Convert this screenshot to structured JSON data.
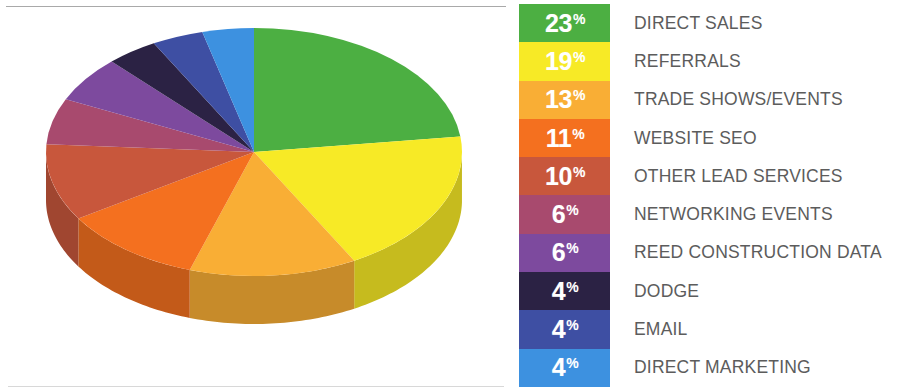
{
  "chart_data": {
    "type": "pie",
    "title": "",
    "subtitle": "",
    "xlabel": "",
    "ylabel": "",
    "legend_position": "right",
    "grid": false,
    "three_d": true,
    "start_angle_deg": 0,
    "direction": "clockwise",
    "units": "%",
    "categories": [
      "DIRECT SALES",
      "REFERRALS",
      "TRADE SHOWS/EVENTS",
      "WEBSITE SEO",
      "OTHER LEAD SERVICES",
      "NETWORKING EVENTS",
      "REED CONSTRUCTION DATA",
      "DODGE",
      "EMAIL",
      "DIRECT MARKETING"
    ],
    "values": [
      23,
      19,
      13,
      11,
      10,
      6,
      6,
      4,
      4,
      4
    ],
    "colors": [
      "#4caf42",
      "#f7ea26",
      "#f9ae35",
      "#f4701f",
      "#c8573c",
      "#a84a6e",
      "#7d4a9e",
      "#2b2244",
      "#3e4fa3",
      "#3d91e0"
    ],
    "total": 100
  },
  "legend": {
    "rows": [
      {
        "pct": "23",
        "sym": "%",
        "label": "DIRECT SALES",
        "color": "#4caf42",
        "color_dark": "#3d9236"
      },
      {
        "pct": "19",
        "sym": "%",
        "label": "REFERRALS",
        "color": "#f7ea26",
        "color_dark": "#d9cd1f"
      },
      {
        "pct": "13",
        "sym": "%",
        "label": "TRADE SHOWS/EVENTS",
        "color": "#f9ae35",
        "color_dark": "#d8932a"
      },
      {
        "pct": "11",
        "sym": "%",
        "label": "WEBSITE SEO",
        "color": "#f4701f",
        "color_dark": "#d25d17"
      },
      {
        "pct": "10",
        "sym": "%",
        "label": "OTHER LEAD SERVICES",
        "color": "#c8573c",
        "color_dark": "#a84630"
      },
      {
        "pct": "6",
        "sym": "%",
        "label": "NETWORKING EVENTS",
        "color": "#a84a6e",
        "color_dark": "#8c3b5b"
      },
      {
        "pct": "6",
        "sym": "%",
        "label": "REED CONSTRUCTION DATA",
        "color": "#7d4a9e",
        "color_dark": "#663b83"
      },
      {
        "pct": "4",
        "sym": "%",
        "label": "DODGE",
        "color": "#2b2244",
        "color_dark": "#1e1832"
      },
      {
        "pct": "4",
        "sym": "%",
        "label": "EMAIL",
        "color": "#3e4fa3",
        "color_dark": "#324086"
      },
      {
        "pct": "4",
        "sym": "%",
        "label": "DIRECT MARKETING",
        "color": "#3d91e0",
        "color_dark": "#3178bb"
      }
    ]
  },
  "pie": {
    "center_x": 214,
    "center_y": 132,
    "radius_x": 208,
    "radius_y": 124,
    "depth": 48
  }
}
